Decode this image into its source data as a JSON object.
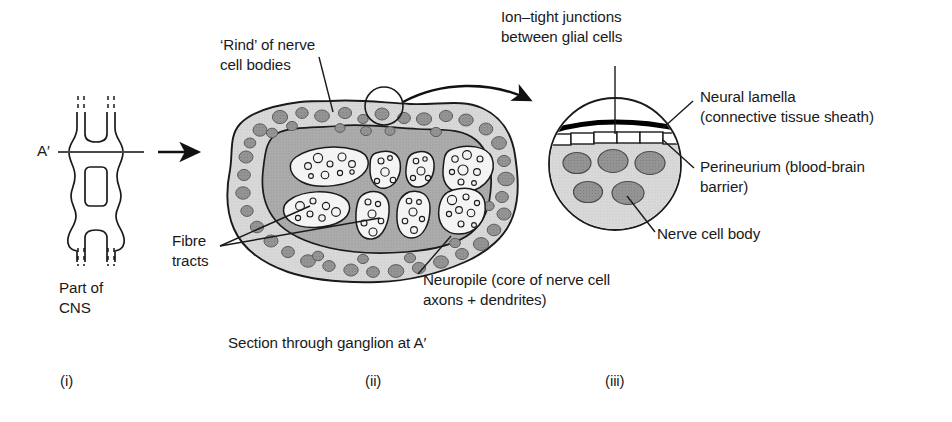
{
  "figure": {
    "title_implicit": "Insect central nervous system: ganglion structure",
    "background": "#ffffff",
    "ink": "#1a1a1a"
  },
  "palette": {
    "outline": "#1a1a1a",
    "rind_fill": "#d6d6d6",
    "neuropile_fill": "#a9a9a9",
    "glial_cell_fill": "#8f8f8f",
    "fibre_tract_fill": "#f2f2f2",
    "nerve_cell_body_fill": "#8a8a8a",
    "neural_lamella": "#000000",
    "perineurium_fill": "#ffffff",
    "section_line": "#4a4a4a"
  },
  "panel_i": {
    "id": "(i)",
    "section_label": "A′",
    "caption_line1": "Part of",
    "caption_line2": "CNS",
    "description": "Schematic of part of the ventral nerve cord showing two ganglia linked by paired connectives, cut at level A′"
  },
  "panel_ii": {
    "id": "(ii)",
    "caption": "Section through ganglion at A′",
    "labels": {
      "rind_line1": "‘Rind’ of nerve",
      "rind_line2": "cell bodies",
      "fibre_line1": "Fibre",
      "fibre_line2": "tracts",
      "neuropile_line1": "Neuropile (core of nerve cell",
      "neuropile_line2": "axons + dendrites)"
    },
    "fibre_tract_count": 8,
    "rind_cell_count": 46
  },
  "panel_iii": {
    "id": "(iii)",
    "labels": {
      "ion_tight_line1": "Ion–tight junctions",
      "ion_tight_line2": "between glial cells",
      "neural_lamella_line1": "Neural lamella",
      "neural_lamella_line2": "(connective tissue sheath)",
      "perineurium_line1": "Perineurium (blood-brain",
      "perineurium_line2": "barrier)",
      "nerve_cell_body": "Nerve cell body"
    },
    "nerve_cell_body_count": 5,
    "perineurium_cell_count": 5
  }
}
